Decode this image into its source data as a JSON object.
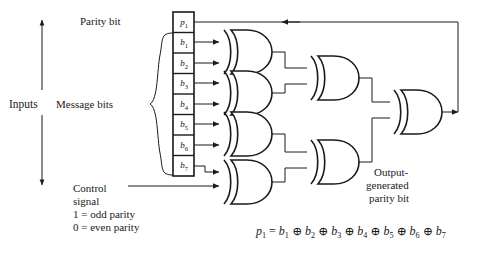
{
  "diagram": {
    "title_equation": "p₁ = b₁ ⊕ b₂ ⊕ b₃ ⊕ b₄ ⊕ b₅ ⊕ b₆ ⊕ b₇",
    "colors": {
      "line": "#1a1a1a",
      "text": "#1a1a1a",
      "background": "#ffffff"
    },
    "labels": {
      "inputs": "Inputs",
      "parity_bit": "Parity bit",
      "message_bits": "Message bits",
      "control_signal_line1": "Control",
      "control_signal_line2": "signal",
      "control_odd": "1 = odd parity",
      "control_even": "0 = even parity",
      "output_line1": "Output-",
      "output_line2": "generated",
      "output_line3": "parity bit"
    },
    "register": {
      "cells": [
        {
          "name": "p",
          "sub": "1"
        },
        {
          "name": "b",
          "sub": "1"
        },
        {
          "name": "b",
          "sub": "2"
        },
        {
          "name": "b",
          "sub": "3"
        },
        {
          "name": "b",
          "sub": "4"
        },
        {
          "name": "b",
          "sub": "5"
        },
        {
          "name": "b",
          "sub": "6"
        },
        {
          "name": "b",
          "sub": "7"
        }
      ]
    },
    "gates": {
      "type": "XOR",
      "stage1_count": 4,
      "stage2_count": 2,
      "stage3_count": 1,
      "stage1_inputs": [
        [
          "b1",
          "b2"
        ],
        [
          "b3",
          "b4"
        ],
        [
          "b5",
          "b6"
        ],
        [
          "b7",
          "control signal"
        ]
      ]
    },
    "equation": {
      "lhs": "p",
      "lhs_sub": "1",
      "eq": "=",
      "terms": [
        "b1",
        "b2",
        "b3",
        "b4",
        "b5",
        "b6",
        "b7"
      ],
      "operator": "⊕"
    }
  }
}
